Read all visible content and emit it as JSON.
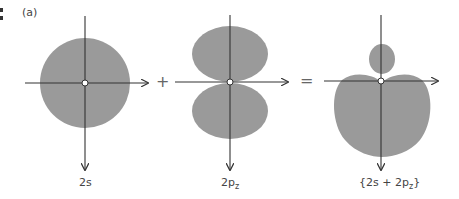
{
  "figure": {
    "panel_label": "(a)",
    "lobe_color": "#9a9a9a",
    "axis_color": "#333333",
    "diagrams": [
      {
        "id": "2s",
        "label": "2s",
        "shape": "circle"
      },
      {
        "id": "2pz",
        "label_main": "2p",
        "label_sub": "z",
        "shape": "dumbbell"
      },
      {
        "id": "hybrid",
        "label_main": "{2s + 2p",
        "label_sub": "z",
        "label_end": "}",
        "shape": "hybrid"
      }
    ],
    "operators": {
      "plus": "+",
      "equals": "="
    }
  }
}
